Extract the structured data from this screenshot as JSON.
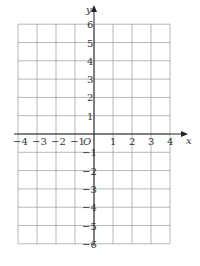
{
  "grid": {
    "x_min": -4,
    "x_max": 4,
    "y_min": -6,
    "y_max": 6,
    "x_axis_label": "x",
    "y_axis_label": "y",
    "origin_label": "O",
    "x_ticks": [
      "-4",
      "-3",
      "-2",
      "-1",
      "1",
      "2",
      "3",
      "4"
    ],
    "y_ticks": [
      "6",
      "5",
      "4",
      "3",
      "2",
      "1",
      "-1",
      "-2",
      "-3",
      "-4",
      "-5",
      "-6"
    ],
    "grid_color": "#999999",
    "axis_color": "#222222"
  }
}
